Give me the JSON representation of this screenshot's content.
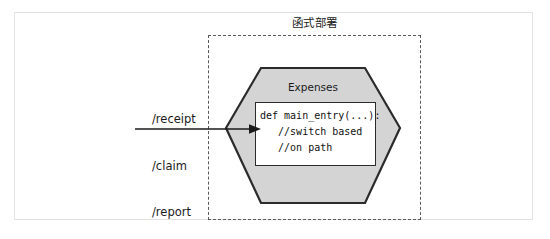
{
  "diagram": {
    "title": "函式部署",
    "outer_frame": {
      "border_color": "#e3e3e3"
    },
    "boundary": {
      "label": "函式部署",
      "style": "dashed",
      "border_color": "#5a5a5a"
    },
    "function_node": {
      "shape": "hexagon",
      "name": "Expenses",
      "fill_color": "#d4d4d4",
      "stroke_color": "#2b2b2b",
      "code_box": {
        "background": "#ffffff",
        "border_color": "#2b2b2b",
        "lines": [
          "def main_entry(...):",
          "   //switch based",
          "   //on path"
        ]
      }
    },
    "incoming": {
      "arrow_color": "#1b1b1b",
      "routes": [
        "/receipt",
        "/claim",
        "/report"
      ]
    }
  }
}
